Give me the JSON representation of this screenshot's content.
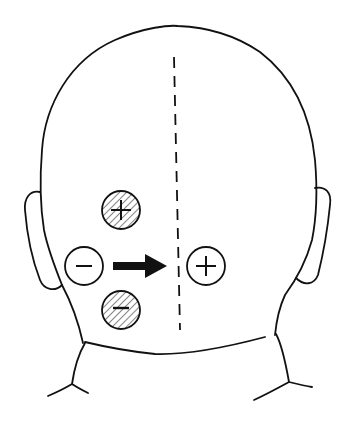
{
  "diagram": {
    "midline": {
      "style": "dashed",
      "x": 174,
      "y1": 57,
      "y2": 330
    },
    "markers": [
      {
        "id": "upper-hatched",
        "symbol": "+",
        "cx": 121,
        "cy": 210,
        "r": 19,
        "hatched": true
      },
      {
        "id": "left-open",
        "symbol": "−",
        "cx": 84,
        "cy": 266,
        "r": 19,
        "hatched": false
      },
      {
        "id": "right-open",
        "symbol": "+",
        "cx": 206,
        "cy": 266,
        "r": 19,
        "hatched": false
      },
      {
        "id": "lower-hatched",
        "symbol": "−",
        "cx": 121,
        "cy": 310,
        "r": 19,
        "hatched": true
      }
    ],
    "arrow": {
      "direction": "right",
      "x1": 113,
      "x2": 166,
      "y": 266
    },
    "colors": {
      "stroke": "#111111",
      "background": "#ffffff"
    }
  }
}
